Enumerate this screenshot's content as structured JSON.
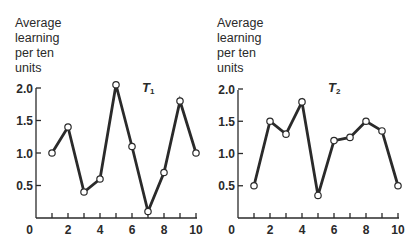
{
  "chart_data": [
    {
      "type": "line",
      "title": "T1",
      "title_main": "T",
      "title_sub": "1",
      "ylabel_lines": [
        "Average",
        "learning",
        "per ten",
        "units"
      ],
      "xlabel": "",
      "x": [
        1,
        2,
        3,
        4,
        5,
        6,
        7,
        8,
        9,
        10
      ],
      "values": [
        1.0,
        1.4,
        0.4,
        0.6,
        2.05,
        1.1,
        0.1,
        0.7,
        1.8,
        1.0
      ],
      "xlim": [
        0,
        10
      ],
      "ylim": [
        0,
        2.0
      ],
      "x_ticks": [
        1,
        2,
        3,
        4,
        5,
        6,
        7,
        8,
        9,
        10
      ],
      "x_tick_labels": [
        "0",
        "2",
        "4",
        "6",
        "8",
        "10"
      ],
      "x_tick_label_values": [
        0,
        2,
        4,
        6,
        8,
        10
      ],
      "y_ticks": [
        0.5,
        1.0,
        1.5,
        2.0
      ],
      "y_tick_labels": [
        "0.5",
        "1.0",
        "1.5",
        "2.0"
      ],
      "markers": "open-circle",
      "grid": false
    },
    {
      "type": "line",
      "title": "T2",
      "title_main": "T",
      "title_sub": "2",
      "ylabel_lines": [
        "Average",
        "learning",
        "per ten",
        "units"
      ],
      "xlabel": "",
      "x": [
        1,
        2,
        3,
        4,
        5,
        6,
        7,
        8,
        9,
        10
      ],
      "values": [
        0.5,
        1.5,
        1.3,
        1.8,
        0.35,
        1.2,
        1.25,
        1.5,
        1.35,
        0.5
      ],
      "xlim": [
        0,
        10
      ],
      "ylim": [
        0,
        2.0
      ],
      "x_ticks": [
        1,
        2,
        3,
        4,
        5,
        6,
        7,
        8,
        9,
        10
      ],
      "x_tick_labels": [
        "0",
        "2",
        "4",
        "6",
        "8",
        "10"
      ],
      "x_tick_label_values": [
        0,
        2,
        4,
        6,
        8,
        10
      ],
      "y_ticks": [
        0.5,
        1.0,
        1.5,
        2.0
      ],
      "y_tick_labels": [
        "0.5",
        "1.0",
        "1.5",
        "2.0"
      ],
      "markers": "open-circle",
      "grid": false
    }
  ]
}
